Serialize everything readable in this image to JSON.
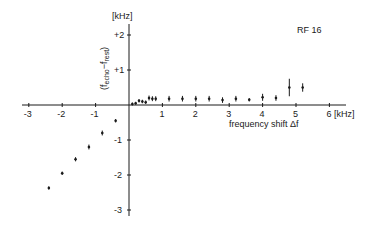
{
  "chart_data": {
    "type": "scatter",
    "title": "RF 16",
    "xlabel": "frequency shift Δf",
    "xunit": "[kHz]",
    "ylabel": "(f_echo − f_rest)",
    "yunit": "[kHz]",
    "xlim": [
      -3.2,
      6.3
    ],
    "ylim": [
      -3.3,
      2.4
    ],
    "x_ticks": [
      -3,
      -2,
      -1,
      1,
      2,
      3,
      4,
      5,
      6
    ],
    "x_tick_labels": [
      "-3",
      "-2",
      "-1",
      "1",
      "2",
      "3",
      "4",
      "5",
      "6"
    ],
    "y_ticks": [
      2,
      1,
      -1,
      -2,
      -3
    ],
    "y_tick_labels": [
      "+2",
      "+1",
      "-1",
      "-2",
      "-3"
    ],
    "grid": false,
    "legend": null,
    "series": [
      {
        "name": "RF 16",
        "points": [
          {
            "x": -2.4,
            "y": -2.37,
            "err": 0.05
          },
          {
            "x": -2.0,
            "y": -1.95,
            "err": 0.05
          },
          {
            "x": -1.6,
            "y": -1.55,
            "err": 0.06
          },
          {
            "x": -1.2,
            "y": -1.2,
            "err": 0.07
          },
          {
            "x": -0.8,
            "y": -0.8,
            "err": 0.07
          },
          {
            "x": -0.4,
            "y": -0.45,
            "err": 0.05
          },
          {
            "x": 0.1,
            "y": 0.03,
            "err": 0.02
          },
          {
            "x": 0.2,
            "y": 0.05,
            "err": 0.02
          },
          {
            "x": 0.3,
            "y": 0.12,
            "err": 0.05
          },
          {
            "x": 0.4,
            "y": 0.1,
            "err": 0.05
          },
          {
            "x": 0.5,
            "y": 0.08,
            "err": 0.05
          },
          {
            "x": 0.6,
            "y": 0.2,
            "err": 0.07
          },
          {
            "x": 0.7,
            "y": 0.18,
            "err": 0.07
          },
          {
            "x": 0.8,
            "y": 0.18,
            "err": 0.07
          },
          {
            "x": 1.2,
            "y": 0.18,
            "err": 0.08
          },
          {
            "x": 1.6,
            "y": 0.18,
            "err": 0.08
          },
          {
            "x": 2.0,
            "y": 0.18,
            "err": 0.08
          },
          {
            "x": 2.4,
            "y": 0.18,
            "err": 0.08
          },
          {
            "x": 2.8,
            "y": 0.14,
            "err": 0.08
          },
          {
            "x": 3.2,
            "y": 0.18,
            "err": 0.08
          },
          {
            "x": 3.6,
            "y": 0.15,
            "err": 0.05
          },
          {
            "x": 4.0,
            "y": 0.22,
            "err": 0.1
          },
          {
            "x": 4.4,
            "y": 0.2,
            "err": 0.08
          },
          {
            "x": 4.8,
            "y": 0.5,
            "err": 0.25
          },
          {
            "x": 5.2,
            "y": 0.5,
            "err": 0.12
          }
        ]
      }
    ]
  },
  "labels": {
    "title": "RF 16",
    "xlabel": "frequency shift Δf",
    "xunit": "6 [kHz]",
    "yunit": "[kHz]",
    "ylabel_main": "(f",
    "ylabel_sub1": "echo",
    "ylabel_mid": "−f",
    "ylabel_sub2": "rest",
    "ylabel_close": ")"
  }
}
